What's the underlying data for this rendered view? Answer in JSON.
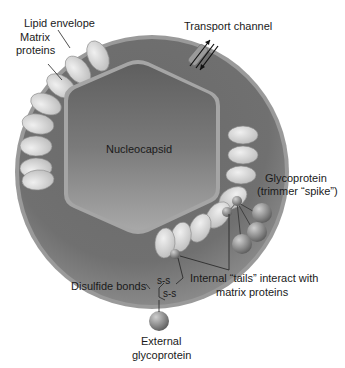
{
  "diagram": {
    "labels": {
      "lipid_envelope": "Lipid envelope",
      "matrix_proteins_line1": "Matrix",
      "matrix_proteins_line2": "proteins",
      "transport_channel": "Transport channel",
      "nucleocapsid": "Nucleocapsid",
      "glycoprotein_line1": "Glycoprotein",
      "glycoprotein_line2": "(trimmer “spike”)",
      "internal_tails_line1": "Internal “tails” interact with",
      "internal_tails_line2": "matrix proteins",
      "disulfide_bonds": "Disulfide bonds",
      "ss_bond_1": "s-s",
      "ss_bond_2": "s-s",
      "external_glycoprotein_line1": "External",
      "external_glycoprotein_line2": "glycoprotein"
    },
    "colors": {
      "envelope_outer": "#8c8c8c",
      "envelope_fill": "#6e6e6e",
      "nucleocapsid_fill": "#7a7a7a",
      "matrix_protein": "#d9d9d9",
      "glycoprotein_sphere": "#8a8a8a",
      "text": "#1a1a1a"
    }
  }
}
